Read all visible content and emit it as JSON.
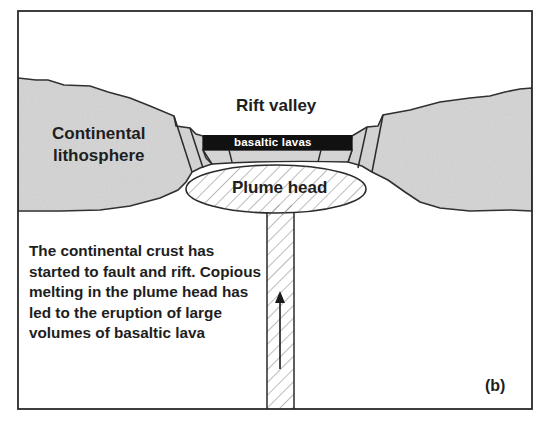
{
  "diagram": {
    "labels": {
      "rift_valley": "Rift valley",
      "continental_line1": "Continental",
      "continental_line2": "lithosphere",
      "basaltic_lavas": "basaltic lavas",
      "plume_head": "Plume head",
      "panel_label": "(b)"
    },
    "caption": "The continental crust has started to fault and rift. Copious melting in the plume head has led to the eruption of large volumes of basaltic lava",
    "colors": {
      "lithosphere_fill": "#d4d4d4",
      "outline": "#2a2a2a",
      "lava_fill": "#111111",
      "background": "#ffffff"
    },
    "flow_arrow_direction": "up"
  }
}
